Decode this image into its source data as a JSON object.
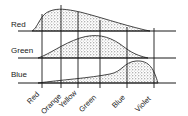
{
  "diagram": {
    "type": "spectral sensitivity curves",
    "rows": [
      {
        "label": "Red",
        "peak_band": "Yellow-Green"
      },
      {
        "label": "Green",
        "peak_band": "Green-Blue"
      },
      {
        "label": "Blue",
        "peak_band": "Blue-Violet"
      }
    ],
    "x_categories": [
      "Red",
      "Orange",
      "Yellow",
      "Green",
      "Blue",
      "Violet"
    ],
    "colors": {
      "line": "#1a1a1a",
      "stipple": "#555555",
      "background": "#ffffff"
    }
  }
}
